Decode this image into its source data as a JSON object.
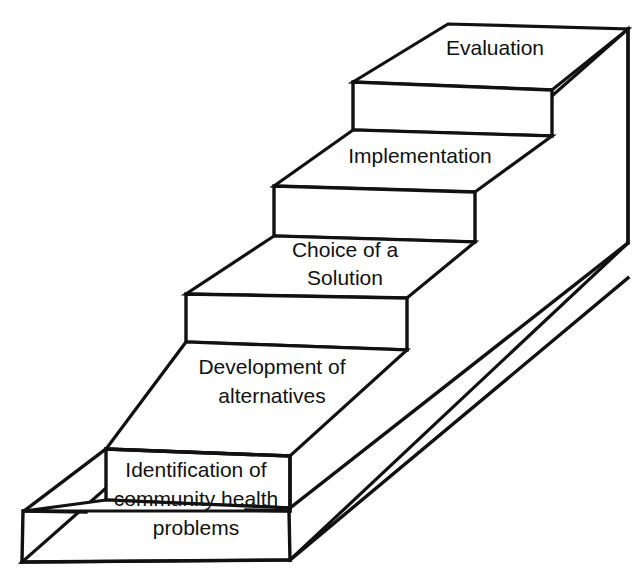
{
  "diagram": {
    "type": "staircase-process",
    "orientation": "ascending-left-to-right-isometric",
    "line_color": "#111111",
    "face_color": "#ffffff",
    "background_color": "#ffffff",
    "step_count": 5,
    "steps": [
      {
        "order": 1,
        "label": "Identification of\ncommunity health\nproblems",
        "lines": [
          "Identification of",
          "community health",
          "problems"
        ]
      },
      {
        "order": 2,
        "label": "Development of\nalternatives",
        "lines": [
          "Development of",
          "alternatives"
        ]
      },
      {
        "order": 3,
        "label": "Choice of a\nSolution",
        "lines": [
          "Choice of a",
          "Solution"
        ]
      },
      {
        "order": 4,
        "label": "Implementation",
        "lines": [
          "Implementation"
        ]
      },
      {
        "order": 5,
        "label": "Evaluation",
        "lines": [
          "Evaluation"
        ]
      }
    ],
    "labels": {
      "step1_line1": "Identification of",
      "step1_line2": "community health",
      "step1_line3": "problems",
      "step2_line1": "Development of",
      "step2_line2": "alternatives",
      "step3_line1": "Choice of a",
      "step3_line2": "Solution",
      "step4_line1": "Implementation",
      "step5_line1": "Evaluation"
    }
  }
}
